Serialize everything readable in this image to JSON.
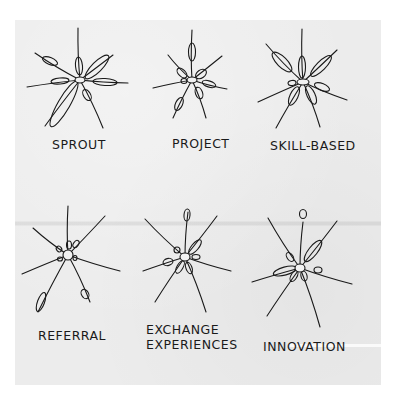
{
  "figure": {
    "ink_color": "#1a1a1a",
    "paper_color": "#ececec",
    "panels": [
      {
        "id": "sprout",
        "label_lines": [
          "SPROUT"
        ],
        "label_pos": [
          52,
          137
        ],
        "center": [
          80,
          80
        ],
        "hub_rx": 5,
        "hub_ry": 3,
        "spokes": [
          {
            "to": [
              78,
              28
            ]
          },
          {
            "to": [
              113,
              55
            ]
          },
          {
            "to": [
              128,
              83
            ]
          },
          {
            "to": [
              103,
              128
            ]
          },
          {
            "to": [
              45,
              126
            ]
          },
          {
            "to": [
              27,
              87
            ]
          },
          {
            "to": [
              35,
              53
            ]
          }
        ],
        "pods": [
          {
            "cx": 79,
            "cy": 66,
            "rx": 3.5,
            "ry": 9,
            "angle": -5
          },
          {
            "cx": 97,
            "cy": 67,
            "rx": 5,
            "ry": 16,
            "angle": 45
          },
          {
            "cx": 105,
            "cy": 82,
            "rx": 12,
            "ry": 3.5,
            "angle": 3
          },
          {
            "cx": 87,
            "cy": 95,
            "rx": 3.5,
            "ry": 6,
            "angle": -30
          },
          {
            "cx": 64,
            "cy": 104,
            "rx": 6,
            "ry": 26,
            "angle": 30
          },
          {
            "cx": 60,
            "cy": 81,
            "rx": 9,
            "ry": 3,
            "angle": -5
          },
          {
            "cx": 50,
            "cy": 61,
            "rx": 8,
            "ry": 3.5,
            "angle": 22
          }
        ]
      },
      {
        "id": "project",
        "label_lines": [
          "PROJECT"
        ],
        "label_pos": [
          172,
          136
        ],
        "center": [
          192,
          80
        ],
        "hub_rx": 5,
        "hub_ry": 3,
        "spokes": [
          {
            "to": [
              192,
              30
            ]
          },
          {
            "to": [
              222,
              56
            ]
          },
          {
            "to": [
              227,
              89
            ]
          },
          {
            "to": [
              206,
              118
            ]
          },
          {
            "to": [
              173,
              118
            ]
          },
          {
            "to": [
              153,
              88
            ]
          },
          {
            "to": [
              168,
              55
            ]
          }
        ],
        "pods": [
          {
            "cx": 192,
            "cy": 52,
            "rx": 3.5,
            "ry": 9,
            "angle": 0
          },
          {
            "cx": 201,
            "cy": 74,
            "rx": 4,
            "ry": 6,
            "angle": 55
          },
          {
            "cx": 209,
            "cy": 84,
            "rx": 7,
            "ry": 3,
            "angle": 18
          },
          {
            "cx": 199,
            "cy": 93,
            "rx": 3.5,
            "ry": 6,
            "angle": -20
          },
          {
            "cx": 179,
            "cy": 104,
            "rx": 3.5,
            "ry": 7,
            "angle": 25
          },
          {
            "cx": 184,
            "cy": 81,
            "rx": 3,
            "ry": 2.5,
            "angle": 0
          },
          {
            "cx": 182,
            "cy": 73,
            "rx": 3.5,
            "ry": 6,
            "angle": -45
          }
        ]
      },
      {
        "id": "skill-based",
        "label_lines": [
          "SKILL-BASED"
        ],
        "label_pos": [
          270,
          138
        ],
        "center": [
          303,
          82
        ],
        "hub_rx": 6,
        "hub_ry": 3,
        "spokes": [
          {
            "to": [
              302,
              29
            ]
          },
          {
            "to": [
              337,
              50
            ]
          },
          {
            "to": [
              347,
              100
            ]
          },
          {
            "to": [
              320,
              127
            ]
          },
          {
            "to": [
              276,
              128
            ]
          },
          {
            "to": [
              258,
              102
            ]
          },
          {
            "to": [
              266,
              44
            ]
          }
        ],
        "pods": [
          {
            "cx": 302,
            "cy": 67,
            "rx": 3.5,
            "ry": 11,
            "angle": 0
          },
          {
            "cx": 321,
            "cy": 66,
            "rx": 4.5,
            "ry": 14,
            "angle": 45
          },
          {
            "cx": 322,
            "cy": 87,
            "rx": 8,
            "ry": 3.5,
            "angle": 22
          },
          {
            "cx": 311,
            "cy": 95,
            "rx": 4,
            "ry": 10,
            "angle": -25
          },
          {
            "cx": 294,
            "cy": 96,
            "rx": 4,
            "ry": 10,
            "angle": 25
          },
          {
            "cx": 292,
            "cy": 83,
            "rx": 4,
            "ry": 2.5,
            "angle": -10
          },
          {
            "cx": 282,
            "cy": 62,
            "rx": 5,
            "ry": 13,
            "angle": -45
          }
        ]
      },
      {
        "id": "referral",
        "label_lines": [
          "REFERRAL"
        ],
        "label_pos": [
          38,
          328
        ],
        "center": [
          68,
          255
        ],
        "hub_rx": 5,
        "hub_ry": 5,
        "spokes": [
          {
            "to": [
              68,
              206
            ]
          },
          {
            "to": [
              105,
              216
            ]
          },
          {
            "to": [
              120,
              271
            ]
          },
          {
            "to": [
              90,
              302
            ]
          },
          {
            "to": [
              38,
              312
            ]
          },
          {
            "to": [
              22,
              274
            ]
          },
          {
            "to": [
              33,
              228
            ]
          }
        ],
        "pods": [
          {
            "cx": 69,
            "cy": 245,
            "rx": 2.5,
            "ry": 4,
            "angle": 0
          },
          {
            "cx": 76,
            "cy": 244,
            "rx": 2.5,
            "ry": 4,
            "angle": 35
          },
          {
            "cx": 75,
            "cy": 258,
            "rx": 2,
            "ry": 2.5,
            "angle": 0
          },
          {
            "cx": 85,
            "cy": 294,
            "rx": 3.5,
            "ry": 5,
            "angle": -30
          },
          {
            "cx": 41,
            "cy": 302,
            "rx": 3.5,
            "ry": 10,
            "angle": 20
          },
          {
            "cx": 60,
            "cy": 259,
            "rx": 2.5,
            "ry": 2,
            "angle": 0
          },
          {
            "cx": 59,
            "cy": 249,
            "rx": 2.5,
            "ry": 3,
            "angle": -40
          }
        ]
      },
      {
        "id": "exchange-experiences",
        "label_lines": [
          "EXCHANGE",
          "EXPERIENCES"
        ],
        "label_pos": [
          146,
          322
        ],
        "center": [
          185,
          257
        ],
        "hub_rx": 5,
        "hub_ry": 4,
        "spokes": [
          {
            "to": [
              188,
              212
            ]
          },
          {
            "to": [
              217,
              216
            ]
          },
          {
            "to": [
              231,
              271
            ]
          },
          {
            "to": [
              206,
              312
            ]
          },
          {
            "to": [
              155,
              302
            ]
          },
          {
            "to": [
              143,
              271
            ]
          },
          {
            "to": [
              145,
              219
            ]
          }
        ],
        "pods": [
          {
            "cx": 187,
            "cy": 215,
            "rx": 3,
            "ry": 6,
            "angle": 5
          },
          {
            "cx": 195,
            "cy": 247,
            "rx": 3.5,
            "ry": 9,
            "angle": 40
          },
          {
            "cx": 196,
            "cy": 257,
            "rx": 4,
            "ry": 2.5,
            "angle": 0
          },
          {
            "cx": 189,
            "cy": 268,
            "rx": 3,
            "ry": 6,
            "angle": -20
          },
          {
            "cx": 180,
            "cy": 267,
            "rx": 3,
            "ry": 7,
            "angle": 30
          },
          {
            "cx": 168,
            "cy": 262,
            "rx": 5,
            "ry": 3.5,
            "angle": -15
          },
          {
            "cx": 177,
            "cy": 250,
            "rx": 3,
            "ry": 3,
            "angle": 0
          }
        ]
      },
      {
        "id": "innovation",
        "label_lines": [
          "INNOVATION"
        ],
        "label_pos": [
          263,
          339
        ],
        "center": [
          300,
          268
        ],
        "hub_rx": 5,
        "hub_ry": 4,
        "spokes": [
          {
            "to": [
              303,
              222
            ]
          },
          {
            "to": [
              337,
              221
            ]
          },
          {
            "to": [
              352,
              284
            ]
          },
          {
            "to": [
              320,
              327
            ]
          },
          {
            "to": [
              267,
              316
            ]
          },
          {
            "to": [
              252,
              282
            ]
          },
          {
            "to": [
              268,
              218
            ]
          }
        ],
        "pods": [
          {
            "cx": 303,
            "cy": 214,
            "rx": 3.5,
            "ry": 4.5,
            "angle": 0
          },
          {
            "cx": 313,
            "cy": 251,
            "rx": 4.5,
            "ry": 13,
            "angle": 38
          },
          {
            "cx": 318,
            "cy": 270,
            "rx": 4,
            "ry": 3,
            "angle": 0
          },
          {
            "cx": 304,
            "cy": 276,
            "rx": 3,
            "ry": 5,
            "angle": -15
          },
          {
            "cx": 294,
            "cy": 276,
            "rx": 3,
            "ry": 6,
            "angle": 30
          },
          {
            "cx": 285,
            "cy": 271,
            "rx": 12,
            "ry": 4,
            "angle": -15
          },
          {
            "cx": 290,
            "cy": 257,
            "rx": 3,
            "ry": 5,
            "angle": -35
          }
        ]
      }
    ]
  }
}
